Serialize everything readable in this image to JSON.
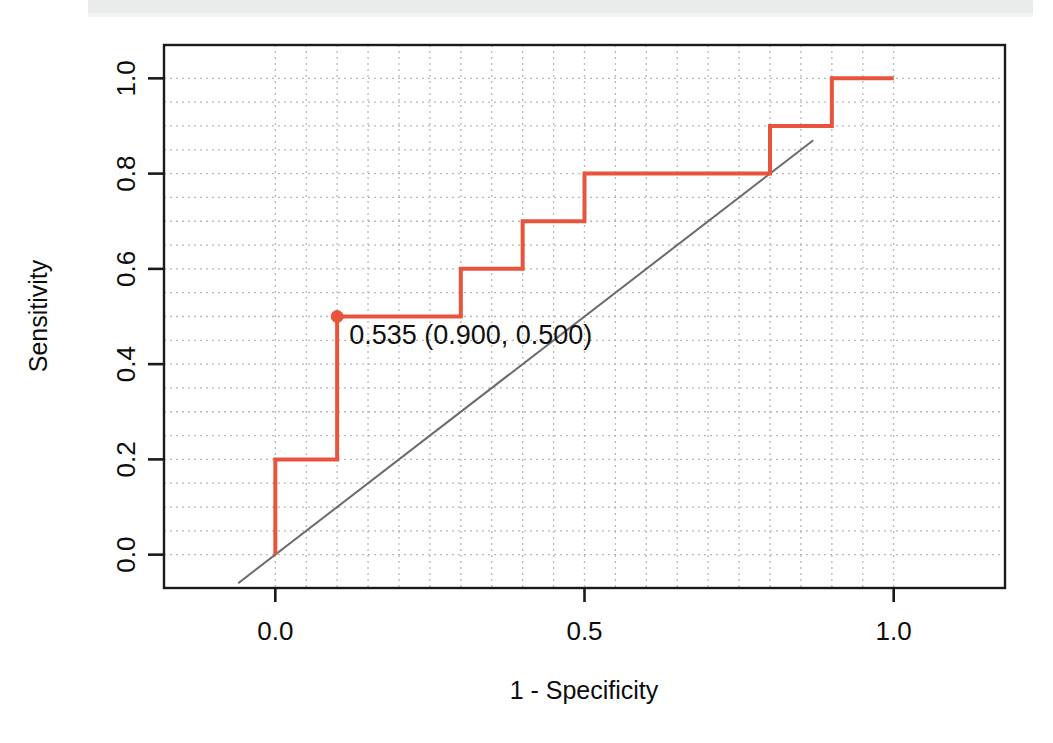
{
  "figure": {
    "title": "",
    "background_color": "#ffffff",
    "scan_artifact": true
  },
  "chart_data": {
    "type": "line",
    "title": "",
    "subtitle": "",
    "xlabel": "1 - Specificity",
    "ylabel": "Sensitivity",
    "xlim": [
      -0.18,
      1.18
    ],
    "ylim": [
      -0.07,
      1.07
    ],
    "xticks": [
      0.0,
      0.5,
      1.0
    ],
    "xtick_labels": [
      "0.0",
      "0.5",
      "1.0"
    ],
    "yticks": [
      0.0,
      0.2,
      0.4,
      0.6,
      0.8,
      1.0
    ],
    "ytick_labels": [
      "0.0",
      "0.2",
      "0.4",
      "0.6",
      "0.8",
      "1.0"
    ],
    "grid": true,
    "grid_style": "dotted",
    "grid_color": "#b8b8b8",
    "grid_spacing": 0.05,
    "legend": false,
    "legend_position": "none",
    "series": [
      {
        "name": "ROC curve",
        "type": "step",
        "color": "#e8543c",
        "line_width": 4,
        "x": [
          0.0,
          0.0,
          0.1,
          0.1,
          0.3,
          0.3,
          0.4,
          0.4,
          0.5,
          0.5,
          0.8,
          0.8,
          0.9,
          0.9,
          1.0
        ],
        "y": [
          0.0,
          0.2,
          0.2,
          0.5,
          0.5,
          0.6,
          0.6,
          0.7,
          0.7,
          0.8,
          0.8,
          0.9,
          0.9,
          1.0,
          1.0
        ]
      },
      {
        "name": "chance diagonal",
        "type": "line",
        "color": "#6b6b6b",
        "line_width": 2,
        "x": [
          -0.06,
          0.87
        ],
        "y": [
          -0.06,
          0.87
        ]
      }
    ],
    "annotations": [
      {
        "name": "optimal-threshold-point",
        "label": "0.535 (0.900, 0.500)",
        "threshold": "0.535",
        "specificity": "0.900",
        "sensitivity": "0.500",
        "x": 0.1,
        "y": 0.5,
        "marker_color": "#e8543c",
        "marker_radius": 6
      }
    ]
  },
  "axes": {
    "box_color": "#1a1a1a",
    "box_width": 2,
    "tick_color": "#1a1a1a"
  }
}
